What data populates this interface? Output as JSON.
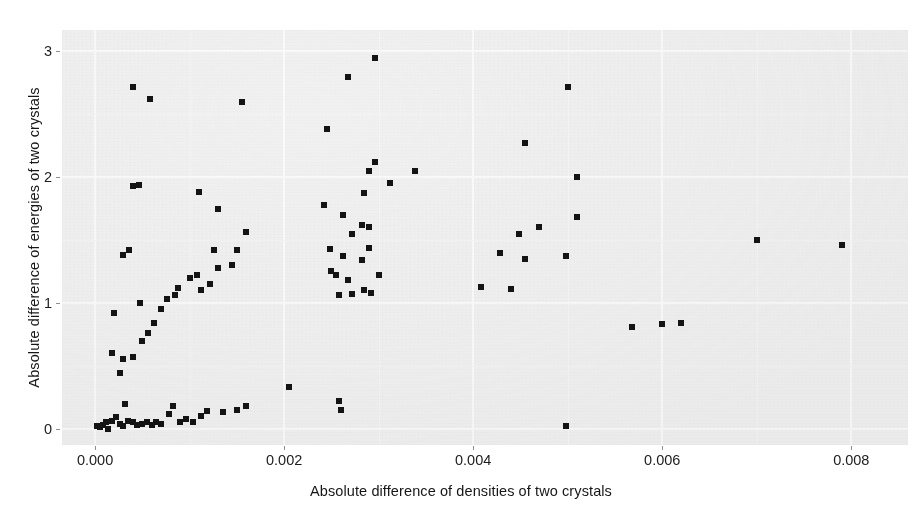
{
  "chart_data": {
    "type": "scatter",
    "title": "",
    "xlabel": "Absolute difference of densities of two crystals",
    "ylabel": "Absolute difference of energies of two crystals",
    "xticks": [
      "0.000",
      "0.002",
      "0.004",
      "0.006",
      "0.008"
    ],
    "xtick_values": [
      0.0,
      0.002,
      0.004,
      0.006,
      0.008
    ],
    "yticks": [
      "0",
      "1",
      "2",
      "3"
    ],
    "ytick_values": [
      0,
      1,
      2,
      3
    ],
    "xlim": [
      -0.00035,
      0.0086
    ],
    "ylim": [
      -0.13,
      3.17
    ],
    "grid": true,
    "legend": null,
    "marker": "square",
    "marker_color": "#141414",
    "panel_color": "#f1f1f1",
    "points": [
      [
        2e-05,
        0.02
      ],
      [
        5e-05,
        0.01
      ],
      [
        8e-05,
        0.03
      ],
      [
        0.00012,
        0.05
      ],
      [
        0.00014,
        0.0
      ],
      [
        0.00018,
        0.06
      ],
      [
        0.00022,
        0.09
      ],
      [
        0.00026,
        0.04
      ],
      [
        0.0003,
        0.02
      ],
      [
        0.00032,
        0.2
      ],
      [
        0.00035,
        0.06
      ],
      [
        0.0004,
        0.05
      ],
      [
        0.00044,
        0.03
      ],
      [
        0.0005,
        0.04
      ],
      [
        0.00055,
        0.05
      ],
      [
        0.0006,
        0.03
      ],
      [
        0.00064,
        0.05
      ],
      [
        0.0007,
        0.04
      ],
      [
        0.00078,
        0.12
      ],
      [
        0.00082,
        0.18
      ],
      [
        0.0009,
        0.05
      ],
      [
        0.00096,
        0.08
      ],
      [
        0.00104,
        0.05
      ],
      [
        0.00112,
        0.1
      ],
      [
        0.00118,
        0.14
      ],
      [
        0.00135,
        0.13
      ],
      [
        0.0015,
        0.15
      ],
      [
        0.0016,
        0.18
      ],
      [
        0.00205,
        0.33
      ],
      [
        0.00026,
        0.44
      ],
      [
        0.0003,
        0.55
      ],
      [
        0.0004,
        0.57
      ],
      [
        0.00018,
        0.6
      ],
      [
        0.0005,
        0.7
      ],
      [
        0.00056,
        0.76
      ],
      [
        0.00062,
        0.84
      ],
      [
        0.0002,
        0.92
      ],
      [
        0.0007,
        0.95
      ],
      [
        0.00048,
        1.0
      ],
      [
        0.00076,
        1.03
      ],
      [
        0.00085,
        1.06
      ],
      [
        0.00088,
        1.12
      ],
      [
        0.00112,
        1.1
      ],
      [
        0.00122,
        1.15
      ],
      [
        0.0013,
        1.28
      ],
      [
        0.00145,
        1.3
      ],
      [
        0.0016,
        1.56
      ],
      [
        0.0015,
        1.42
      ],
      [
        0.00126,
        1.42
      ],
      [
        0.0003,
        1.38
      ],
      [
        0.00036,
        1.42
      ],
      [
        0.001,
        1.2
      ],
      [
        0.00108,
        1.22
      ],
      [
        0.0013,
        1.75
      ],
      [
        0.0004,
        1.93
      ],
      [
        0.00046,
        1.94
      ],
      [
        0.0011,
        1.88
      ],
      [
        0.0004,
        2.72
      ],
      [
        0.00058,
        2.62
      ],
      [
        0.00155,
        2.6
      ],
      [
        0.00258,
        1.06
      ],
      [
        0.00272,
        1.07
      ],
      [
        0.00284,
        1.1
      ],
      [
        0.00292,
        1.08
      ],
      [
        0.00268,
        1.18
      ],
      [
        0.00255,
        1.22
      ],
      [
        0.0025,
        1.25
      ],
      [
        0.003,
        1.22
      ],
      [
        0.00282,
        1.34
      ],
      [
        0.00262,
        1.37
      ],
      [
        0.00248,
        1.43
      ],
      [
        0.0029,
        1.44
      ],
      [
        0.00272,
        1.55
      ],
      [
        0.0029,
        1.6
      ],
      [
        0.00282,
        1.62
      ],
      [
        0.00262,
        1.7
      ],
      [
        0.00242,
        1.78
      ],
      [
        0.00285,
        1.87
      ],
      [
        0.00312,
        1.95
      ],
      [
        0.0029,
        2.05
      ],
      [
        0.00296,
        2.12
      ],
      [
        0.00338,
        2.05
      ],
      [
        0.00245,
        2.38
      ],
      [
        0.00268,
        2.8
      ],
      [
        0.00296,
        2.95
      ],
      [
        0.00258,
        0.22
      ],
      [
        0.0026,
        0.15
      ],
      [
        0.00408,
        1.13
      ],
      [
        0.0044,
        1.11
      ],
      [
        0.00455,
        1.35
      ],
      [
        0.00428,
        1.4
      ],
      [
        0.00448,
        1.55
      ],
      [
        0.0047,
        1.6
      ],
      [
        0.00498,
        1.37
      ],
      [
        0.0051,
        1.68
      ],
      [
        0.0051,
        2.0
      ],
      [
        0.00455,
        2.27
      ],
      [
        0.005,
        2.72
      ],
      [
        0.00498,
        0.02
      ],
      [
        0.00568,
        0.81
      ],
      [
        0.006,
        0.83
      ],
      [
        0.0062,
        0.84
      ],
      [
        0.007,
        1.5
      ],
      [
        0.0079,
        1.46
      ]
    ]
  },
  "axes": {
    "x_title": "Absolute difference of densities of two crystals",
    "y_title": "Absolute difference of energies of two crystals"
  }
}
